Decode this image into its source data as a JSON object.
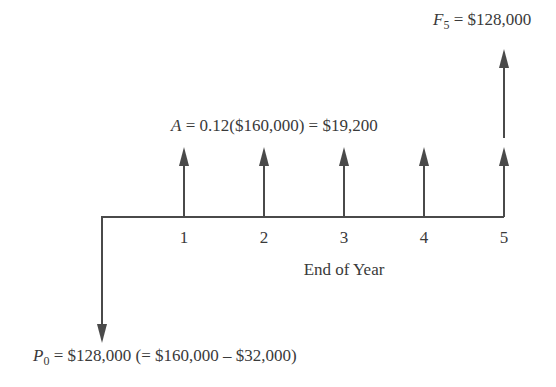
{
  "diagram": {
    "type": "cash-flow-diagram",
    "colors": {
      "line": "#4a4a4a",
      "text": "#3a3a3a",
      "background": "#ffffff"
    },
    "time_axis": {
      "label": "End of Year",
      "ticks": [
        "1",
        "2",
        "3",
        "4",
        "5"
      ]
    },
    "future_value": {
      "symbol": "F",
      "subscript": "5",
      "equals": " = $128,000",
      "year": 5,
      "direction": "up"
    },
    "annuity": {
      "symbol": "A",
      "equals": " = 0.12($160,000) = $19,200",
      "years": [
        1,
        2,
        3,
        4,
        5
      ],
      "direction": "up"
    },
    "present_value": {
      "symbol": "P",
      "subscript": "0",
      "equals": " = $128,000 (= $160,000 – $32,000)",
      "year": 0,
      "direction": "down"
    }
  }
}
